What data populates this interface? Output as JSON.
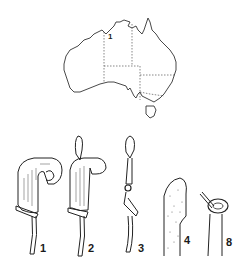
{
  "map": {
    "region": "Australia",
    "marker_label": "1"
  },
  "figures": [
    {
      "label": "1"
    },
    {
      "label": "2"
    },
    {
      "label": "3"
    },
    {
      "label": "4"
    },
    {
      "label": "8"
    }
  ],
  "colors": {
    "ink": "#1a1a1a",
    "background": "#ffffff"
  }
}
